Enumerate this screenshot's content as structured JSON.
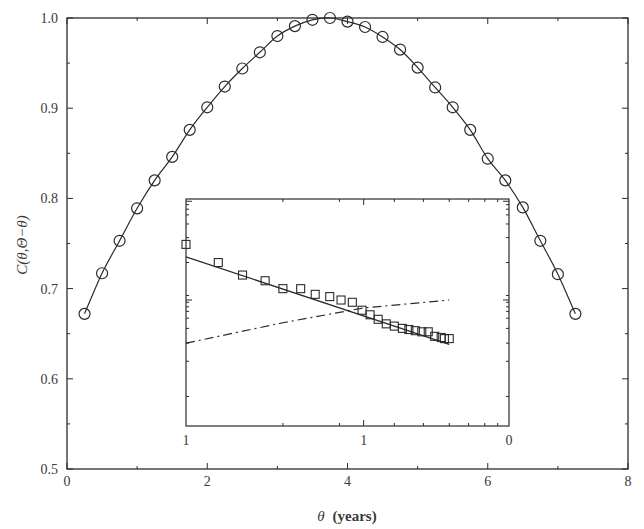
{
  "chart_data": [
    {
      "id": "main",
      "type": "line",
      "title": "",
      "xlabel": "θ (years)",
      "xlabel_italic_part": "θ",
      "xlabel_bold_part": "(years)",
      "ylabel": "C(θ,Θ−θ)",
      "xlim": [
        0,
        8
      ],
      "ylim": [
        0.5,
        1.0
      ],
      "x_ticks": [
        0,
        2,
        4,
        6,
        8
      ],
      "x_tick_labels": [
        "0",
        "2",
        "4",
        "6",
        "8"
      ],
      "x_minor_ticks": [
        1,
        3,
        5,
        7
      ],
      "y_ticks": [
        0.5,
        0.6,
        0.7,
        0.8,
        0.9,
        1.0
      ],
      "y_tick_labels": [
        "0.5",
        "0.6",
        "0.7",
        "0.8",
        "0.9",
        "1.0"
      ],
      "y_minor_ticks": [
        0.55,
        0.65,
        0.75,
        0.85,
        0.95
      ],
      "grid": false,
      "legend": null,
      "series": [
        {
          "name": "data",
          "marker": "open-circle",
          "line": "solid",
          "x": [
            0.25,
            0.5,
            0.75,
            1.0,
            1.25,
            1.5,
            1.75,
            2.0,
            2.25,
            2.5,
            2.75,
            3.0,
            3.25,
            3.5,
            3.75,
            4.0,
            4.25,
            4.5,
            4.75,
            5.0,
            5.25,
            5.5,
            5.75,
            6.0,
            6.25,
            6.5,
            6.75,
            7.0,
            7.25
          ],
          "y": [
            0.672,
            0.717,
            0.753,
            0.789,
            0.82,
            0.846,
            0.876,
            0.901,
            0.924,
            0.944,
            0.962,
            0.98,
            0.991,
            0.998,
            1.0,
            0.996,
            0.99,
            0.979,
            0.965,
            0.945,
            0.923,
            0.901,
            0.876,
            0.844,
            0.82,
            0.79,
            0.753,
            0.716,
            0.672
          ]
        }
      ]
    },
    {
      "id": "inset",
      "type": "scatter",
      "title": "",
      "xlabel": "",
      "ylabel": "",
      "x_scale": "log",
      "y_scale": "log",
      "x_tick_labels": [
        "1",
        "1",
        "0"
      ],
      "x_tick_positions_frac": [
        0.0,
        0.55,
        1.0
      ],
      "y_tick_labels": [],
      "grid": false,
      "legend": null,
      "series": [
        {
          "name": "data",
          "marker": "open-square",
          "line": "none",
          "points_frac": [
            [
              0.0,
              0.8
            ],
            [
              0.1,
              0.72
            ],
            [
              0.175,
              0.665
            ],
            [
              0.245,
              0.64
            ],
            [
              0.3,
              0.605
            ],
            [
              0.355,
              0.605
            ],
            [
              0.4,
              0.58
            ],
            [
              0.445,
              0.57
            ],
            [
              0.48,
              0.555
            ],
            [
              0.515,
              0.545
            ],
            [
              0.545,
              0.51
            ],
            [
              0.57,
              0.49
            ],
            [
              0.595,
              0.47
            ],
            [
              0.62,
              0.45
            ],
            [
              0.645,
              0.44
            ],
            [
              0.67,
              0.43
            ],
            [
              0.69,
              0.425
            ],
            [
              0.71,
              0.42
            ],
            [
              0.73,
              0.415
            ],
            [
              0.75,
              0.415
            ],
            [
              0.77,
              0.395
            ],
            [
              0.79,
              0.39
            ],
            [
              0.8,
              0.385
            ],
            [
              0.815,
              0.385
            ]
          ]
        },
        {
          "name": "fit",
          "marker": "none",
          "line": "solid",
          "points_frac": [
            [
              0.0,
              0.745
            ],
            [
              0.815,
              0.36
            ]
          ]
        },
        {
          "name": "trend",
          "marker": "none",
          "line": "dash-dot",
          "points_frac": [
            [
              0.0,
              0.365
            ],
            [
              0.3,
              0.455
            ],
            [
              0.55,
              0.52
            ],
            [
              0.815,
              0.555
            ]
          ]
        }
      ]
    }
  ]
}
